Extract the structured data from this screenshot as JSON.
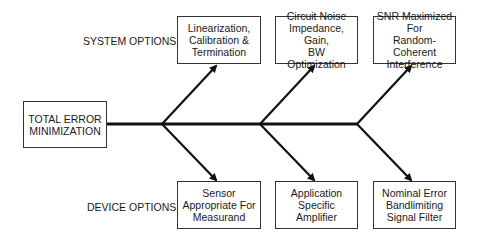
{
  "root": {
    "label": "TOTAL ERROR\nMINIMIZATION"
  },
  "rows": {
    "system": {
      "label": "SYSTEM OPTIONS"
    },
    "device": {
      "label": "DEVICE OPTIONS"
    }
  },
  "system_options": [
    {
      "label": "Linearization,\nCalibration &\nTermination"
    },
    {
      "label": "Circuit Noise\nImpedance, Gain,\nBW Optimization"
    },
    {
      "label": "SNR Maximized For\nRandom-Coherent\nInterference"
    }
  ],
  "device_options": [
    {
      "label": "Sensor\nAppropriate For\nMeasurand"
    },
    {
      "label": "Application\nSpecific\nAmplifier"
    },
    {
      "label": "Nominal Error\nBandlimiting\nSignal Filter"
    }
  ],
  "colors": {
    "line": "#111111",
    "box_border": "#333333",
    "background": "#ffffff"
  }
}
